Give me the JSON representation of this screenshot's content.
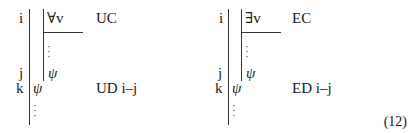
{
  "equation_number": "(12)",
  "proofs": [
    {
      "id": "universal",
      "lines": [
        {
          "label": "i",
          "formula": "∀v",
          "rule": "UC"
        },
        {
          "label": "j",
          "formula": "ψ",
          "rule": ""
        },
        {
          "label": "k",
          "formula": "ψ",
          "rule": "UD i–j"
        }
      ],
      "dots": [
        "·",
        "·",
        "·"
      ]
    },
    {
      "id": "existential",
      "lines": [
        {
          "label": "i",
          "formula": "∃v",
          "rule": "EC"
        },
        {
          "label": "j",
          "formula": "ψ",
          "rule": ""
        },
        {
          "label": "k",
          "formula": "ψ",
          "rule": "ED i–j"
        }
      ],
      "dots": [
        "·",
        "·",
        "·"
      ]
    }
  ]
}
